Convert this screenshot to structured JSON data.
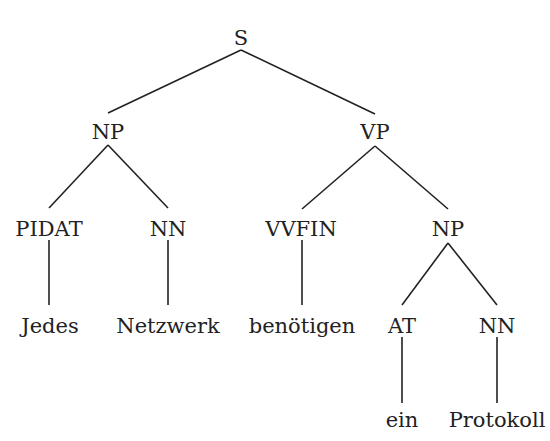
{
  "diagram": {
    "type": "constituency-parse-tree",
    "sentence": "Jedes Netzwerk benötigen ein Protokoll",
    "colors": {
      "background": "#ffffff",
      "ink": "#222222"
    },
    "nodes": [
      {
        "id": "s",
        "label": "S",
        "x": 241,
        "y": 38
      },
      {
        "id": "np1",
        "label": "NP",
        "x": 108,
        "y": 132
      },
      {
        "id": "vp",
        "label": "VP",
        "x": 375,
        "y": 132
      },
      {
        "id": "pidat",
        "label": "PIDAT",
        "x": 49,
        "y": 229
      },
      {
        "id": "nn1",
        "label": "NN",
        "x": 168,
        "y": 229
      },
      {
        "id": "vvfin",
        "label": "VVFIN",
        "x": 301,
        "y": 229
      },
      {
        "id": "np2",
        "label": "NP",
        "x": 448,
        "y": 229
      },
      {
        "id": "w_jedes",
        "label": "Jedes",
        "x": 50,
        "y": 326
      },
      {
        "id": "w_netz",
        "label": "Netzwerk",
        "x": 168,
        "y": 326
      },
      {
        "id": "w_ben",
        "label": "benötigen",
        "x": 302,
        "y": 326
      },
      {
        "id": "at",
        "label": "AT",
        "x": 402,
        "y": 326
      },
      {
        "id": "nn2",
        "label": "NN",
        "x": 497,
        "y": 326
      },
      {
        "id": "w_ein",
        "label": "ein",
        "x": 402,
        "y": 420
      },
      {
        "id": "w_proto",
        "label": "Protokoll",
        "x": 497,
        "y": 420
      }
    ],
    "edges": [
      {
        "from": "s",
        "to": "np1",
        "x1": 241,
        "y1": 50,
        "x2": 108,
        "y2": 113
      },
      {
        "from": "s",
        "to": "vp",
        "x1": 241,
        "y1": 50,
        "x2": 375,
        "y2": 114
      },
      {
        "from": "np1",
        "to": "pidat",
        "x1": 108,
        "y1": 145,
        "x2": 49,
        "y2": 208
      },
      {
        "from": "np1",
        "to": "nn1",
        "x1": 108,
        "y1": 145,
        "x2": 168,
        "y2": 208
      },
      {
        "from": "vp",
        "to": "vvfin",
        "x1": 375,
        "y1": 146,
        "x2": 302,
        "y2": 209
      },
      {
        "from": "vp",
        "to": "np2",
        "x1": 375,
        "y1": 146,
        "x2": 448,
        "y2": 209
      },
      {
        "from": "pidat",
        "to": "w_jedes",
        "x1": 49,
        "y1": 240,
        "x2": 49,
        "y2": 305
      },
      {
        "from": "nn1",
        "to": "w_netz",
        "x1": 168,
        "y1": 240,
        "x2": 168,
        "y2": 305
      },
      {
        "from": "vvfin",
        "to": "w_ben",
        "x1": 302,
        "y1": 240,
        "x2": 302,
        "y2": 305
      },
      {
        "from": "np2",
        "to": "at",
        "x1": 448,
        "y1": 243,
        "x2": 402,
        "y2": 305
      },
      {
        "from": "np2",
        "to": "nn2",
        "x1": 448,
        "y1": 243,
        "x2": 497,
        "y2": 305
      },
      {
        "from": "at",
        "to": "w_ein",
        "x1": 402,
        "y1": 337,
        "x2": 402,
        "y2": 403
      },
      {
        "from": "nn2",
        "to": "w_proto",
        "x1": 497,
        "y1": 337,
        "x2": 497,
        "y2": 403
      }
    ]
  }
}
